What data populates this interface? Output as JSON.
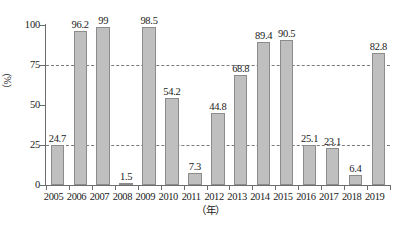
{
  "chart_data": {
    "type": "bar",
    "title": "",
    "xlabel": "（年）",
    "ylabel": "（%）",
    "ylim": [
      0,
      100
    ],
    "yticks": [
      0,
      25,
      50,
      75,
      100
    ],
    "gridlines": [
      25,
      75
    ],
    "grid": "dashed horizontal at 25 and 75",
    "legend": "none",
    "bar_color": "#bfbfbf",
    "bar_border_color": "#8c8c8c",
    "grid_color": "#7b7b7b",
    "axis_color": "#6d6d6d",
    "background": "#ffffff",
    "categories": [
      "2005",
      "2006",
      "2007",
      "2008",
      "2009",
      "2010",
      "2011",
      "2012",
      "2013",
      "2014",
      "2015",
      "2016",
      "2017",
      "2018",
      "2019"
    ],
    "values": [
      24.7,
      96.2,
      99,
      1.5,
      98.5,
      54.2,
      7.3,
      44.8,
      68.8,
      89.4,
      90.5,
      25.1,
      23.1,
      6.4,
      82.8
    ],
    "value_labels": [
      "24.7",
      "96.2",
      "99",
      "1.5",
      "98.5",
      "54.2",
      "7.3",
      "44.8",
      "68.8",
      "89.4",
      "90.5",
      "25.1",
      "23.1",
      "6.4",
      "82.8"
    ],
    "ytick_labels": [
      "0",
      "25",
      "50",
      "75",
      "100"
    ]
  }
}
